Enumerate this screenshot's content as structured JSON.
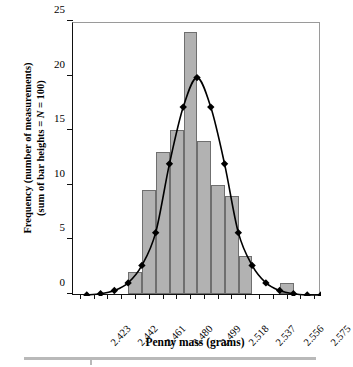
{
  "chart_data": {
    "type": "bar",
    "title": "",
    "xlabel": "Penny mass (grams)",
    "ylabel_line1": "Frequency (number of measurements)",
    "ylabel_line2_pre": "(sum of bar heights = ",
    "ylabel_line2_italic": "N",
    "ylabel_line2_post": " = 100)",
    "ylabel_full": "Frequency (number of measurements) (sum of bar heights = N = 100)",
    "xlim": [
      2.4135,
      2.5845
    ],
    "ylim": [
      0,
      25
    ],
    "grid": false,
    "legend": null,
    "xtick_labels": [
      "2.423",
      "2.442",
      "2.461",
      "2.480",
      "2.499",
      "2.518",
      "2.537",
      "2.556",
      "2.575"
    ],
    "xtick_values": [
      2.423,
      2.442,
      2.461,
      2.48,
      2.499,
      2.518,
      2.537,
      2.556,
      2.575
    ],
    "ytick_labels": [
      "0",
      "5",
      "10",
      "15",
      "20",
      "25"
    ],
    "ytick_values": [
      0,
      5,
      10,
      15,
      20,
      25
    ],
    "bin_width": 0.0095,
    "bars": [
      {
        "center": 2.4565,
        "value": 2
      },
      {
        "center": 2.466,
        "value": 9.5
      },
      {
        "center": 2.4755,
        "value": 13
      },
      {
        "center": 2.485,
        "value": 15
      },
      {
        "center": 2.4945,
        "value": 24
      },
      {
        "center": 2.504,
        "value": 14
      },
      {
        "center": 2.5135,
        "value": 10
      },
      {
        "center": 2.523,
        "value": 9
      },
      {
        "center": 2.5325,
        "value": 3.5
      },
      {
        "center": 2.561,
        "value": 1
      }
    ],
    "curve": {
      "name": "Gaussian fit",
      "marker": "diamond",
      "x": [
        2.423,
        2.4325,
        2.442,
        2.4515,
        2.461,
        2.4705,
        2.48,
        2.4895,
        2.499,
        2.5085,
        2.518,
        2.5275,
        2.537,
        2.5465,
        2.556,
        2.5655,
        2.575,
        2.5845
      ],
      "y": [
        0.1,
        0.2,
        0.5,
        1.2,
        2.8,
        5.8,
        12.1,
        17.3,
        20.0,
        17.3,
        12.1,
        5.8,
        2.8,
        1.2,
        0.5,
        0.2,
        0.1,
        0.1
      ]
    },
    "colors": {
      "bar_fill": "#b2b2b2",
      "bar_stroke": "#6f6f6f",
      "curve": "#000000",
      "axis": "#111111",
      "frame": "#9a9a9a",
      "rule": "#b9b9b9"
    }
  }
}
